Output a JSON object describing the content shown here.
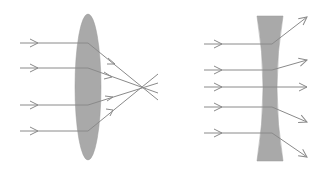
{
  "diagram": {
    "colors": {
      "background": "#ffffff",
      "lens_fill": "#a9a9a9",
      "ray_stroke": "#8a8a8a"
    },
    "convex_lens": {
      "label": "convex-lens",
      "center": [
        88,
        87
      ],
      "rx": 13,
      "ry": 73,
      "focal_point": [
        143,
        88
      ],
      "rays_y": [
        43,
        68,
        105,
        131
      ]
    },
    "concave_lens": {
      "label": "concave-lens",
      "top_y": 16,
      "bottom_y": 161,
      "top_x": [
        257,
        283
      ],
      "waist_x": [
        265,
        277
      ],
      "rays_y": [
        44,
        70,
        87,
        107,
        133
      ]
    }
  }
}
